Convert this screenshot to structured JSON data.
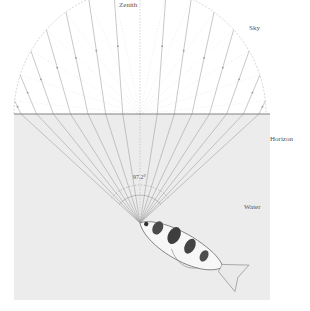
{
  "labels": {
    "zenith": "Zenith",
    "sky": "Sky",
    "horizon": "Horizon",
    "water": "Water",
    "angle": "97.2°"
  },
  "geometry": {
    "center_x": 140,
    "center_y": 114,
    "radius": 126,
    "apex_x": 140,
    "apex_y": 223,
    "water_box": {
      "x": 14,
      "y": 114,
      "w": 256,
      "h": 186
    }
  },
  "colors": {
    "water_fill": "#ececec",
    "line": "#9a9a9a",
    "horizon_line": "#777777",
    "text": "#555555"
  },
  "rays": {
    "sky_angles_deg": [
      0,
      12,
      24,
      36,
      48,
      60,
      72,
      84
    ],
    "water_angles_deg": [
      0,
      9,
      17.5,
      25.5,
      32.5,
      38.5,
      43.5,
      47.5
    ]
  }
}
